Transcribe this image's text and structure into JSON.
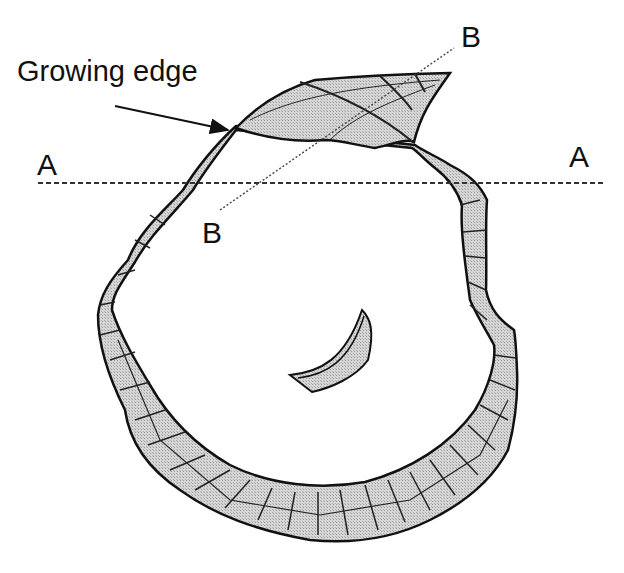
{
  "diagram": {
    "labels": {
      "growing_edge": "Growing edge",
      "a_left": "A",
      "a_right": "A",
      "b_upper": "B",
      "b_lower": "B"
    },
    "lines": {
      "section_A": {
        "style": "dashed",
        "from": [
          38,
          183
        ],
        "to": [
          606,
          183
        ]
      },
      "section_B": {
        "style": "dotted",
        "from": [
          220,
          210
        ],
        "to": [
          454,
          48
        ]
      }
    },
    "arrow": {
      "label_ref": "growing_edge",
      "from": [
        115,
        106
      ],
      "to": [
        228,
        130
      ]
    },
    "colors": {
      "outline": "#111111",
      "shell_fill": "#cfcfcf",
      "background": "#ffffff",
      "text": "#111111"
    }
  }
}
